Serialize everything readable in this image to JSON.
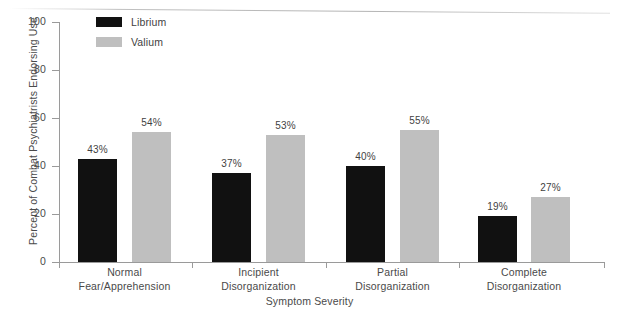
{
  "chart_data": {
    "type": "bar",
    "title": "",
    "subtitle": "",
    "xlabel": "Symptom Severity",
    "ylabel": "Percent of Combat Psychiatrists Endorsing Use",
    "ylim": [
      0,
      100
    ],
    "yticks": [
      0,
      20,
      40,
      60,
      80,
      100
    ],
    "ytick_labels": [
      "0",
      "20",
      "40",
      "60",
      "80",
      "100"
    ],
    "grid": false,
    "legend_position": "top-left",
    "categories": [
      "Normal Fear/Apprehension",
      "Incipient Disorganization",
      "Partial Disorganization",
      "Complete Disorganization"
    ],
    "category_lines": [
      [
        "Normal",
        "Fear/Apprehension"
      ],
      [
        "Incipient",
        "Disorganization"
      ],
      [
        "Partial",
        "Disorganization"
      ],
      [
        "Complete",
        "Disorganization"
      ]
    ],
    "series": [
      {
        "name": "Librium",
        "color": "#111111",
        "values": [
          43,
          37,
          40,
          19
        ],
        "value_labels": [
          "43%",
          "37%",
          "40%",
          "19%"
        ]
      },
      {
        "name": "Valium",
        "color": "#bfbfbf",
        "values": [
          54,
          53,
          55,
          27
        ],
        "value_labels": [
          "54%",
          "53%",
          "55%",
          "27%"
        ]
      }
    ]
  },
  "legend": {
    "items": [
      {
        "label": "Librium",
        "color": "#111111"
      },
      {
        "label": "Valium",
        "color": "#bfbfbf"
      }
    ]
  },
  "axes": {
    "y_title": "Percent of Combat Psychiatrists Endorsing Use",
    "x_title": "Symptom Severity",
    "y_tick_labels": [
      "100",
      "80",
      "60",
      "40",
      "20",
      "0"
    ]
  }
}
